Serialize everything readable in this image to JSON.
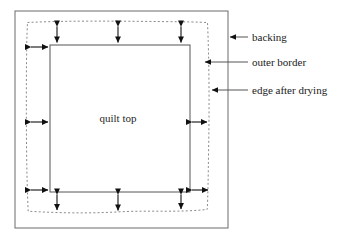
{
  "figure": {
    "background_color": "#ffffff",
    "line_color": "#555555",
    "dotted_line_color": "#8a8a8a",
    "arrow_color": "#111111",
    "text_color": "#1a1a1a"
  },
  "regions": {
    "backing": {
      "name": "backing",
      "x": 15,
      "y": 11,
      "width": 213,
      "height": 217
    },
    "edge_after_drying": {
      "name": "edge after drying",
      "x": 26,
      "y": 22,
      "width": 182,
      "height": 191
    },
    "quilt_top": {
      "name": "quilt top",
      "label": "quilt top",
      "label_x": 118,
      "label_y": 122,
      "x": 50,
      "y": 45,
      "width": 140,
      "height": 147
    }
  },
  "labels": [
    {
      "id": "backing",
      "text": "backing",
      "text_x": 252,
      "text_y": 41,
      "leader_x1": 228,
      "leader_x2": 248,
      "leader_y": 37,
      "arrowhead": "left"
    },
    {
      "id": "outer-border",
      "text": "outer border",
      "text_x": 252,
      "text_y": 66,
      "leader_x1": 203,
      "leader_x2": 248,
      "leader_y": 62,
      "arrowhead": "left"
    },
    {
      "id": "edge-after-drying",
      "text": "edge after drying",
      "text_x": 252,
      "text_y": 94,
      "leader_x1": 210,
      "leader_x2": 248,
      "leader_y": 90,
      "arrowhead": "left"
    }
  ],
  "measure_arrows": [
    {
      "id": "top-left-vertical",
      "orientation": "vertical",
      "x": 57,
      "y1": 24,
      "y2": 45
    },
    {
      "id": "top-center-vertical",
      "orientation": "vertical",
      "x": 118,
      "y1": 24,
      "y2": 45
    },
    {
      "id": "top-right-vertical",
      "orientation": "vertical",
      "x": 181,
      "y1": 24,
      "y2": 45
    },
    {
      "id": "upper-left-horizontal",
      "orientation": "horizontal",
      "y": 47,
      "x1": 29,
      "x2": 50
    },
    {
      "id": "middle-left-horizontal",
      "orientation": "horizontal",
      "y": 122,
      "x1": 29,
      "x2": 50
    },
    {
      "id": "middle-right-horizontal",
      "orientation": "horizontal",
      "y": 122,
      "x1": 190,
      "x2": 208
    },
    {
      "id": "lower-left-horizontal",
      "orientation": "horizontal",
      "y": 190,
      "x1": 29,
      "x2": 50
    },
    {
      "id": "lower-right-horizontal",
      "orientation": "horizontal",
      "y": 190,
      "x1": 190,
      "x2": 209
    },
    {
      "id": "bottom-left-vertical",
      "orientation": "vertical",
      "x": 57,
      "y1": 192,
      "y2": 212
    },
    {
      "id": "bottom-center-vertical",
      "orientation": "vertical",
      "x": 118,
      "y1": 192,
      "y2": 213
    },
    {
      "id": "bottom-right-vertical",
      "orientation": "vertical",
      "x": 181,
      "y1": 192,
      "y2": 211
    }
  ]
}
